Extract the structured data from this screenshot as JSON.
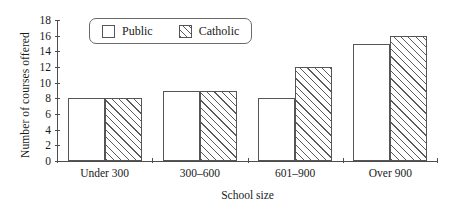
{
  "chart_data": {
    "type": "bar",
    "title": "",
    "xlabel": "School size",
    "ylabel": "Number of courses offered",
    "categories": [
      "Under 300",
      "300–600",
      "601–900",
      "Over 900"
    ],
    "series": [
      {
        "name": "Public",
        "values": [
          8,
          9,
          8,
          15
        ],
        "fill": "solid-white",
        "swatch": "legend-swatch-public"
      },
      {
        "name": "Catholic",
        "values": [
          8,
          9,
          12,
          16
        ],
        "fill": "diagonal-hatch",
        "swatch": "legend-swatch-catholic"
      }
    ],
    "ylim": [
      0,
      18
    ],
    "ytick_values": [
      0,
      2,
      4,
      6,
      8,
      10,
      12,
      14,
      16,
      18
    ],
    "ytick_labels": [
      "0",
      "2",
      "4",
      "6",
      "8",
      "10",
      "12",
      "14",
      "16",
      "18"
    ],
    "grid": false,
    "legend_position": "top-left-inside",
    "colors": {
      "axis": "#4d4d4d",
      "bar_outline": "#555555",
      "hatch": "#5a5a5a",
      "background": "#ffffff",
      "text": "#1a1a1a"
    }
  },
  "legend": {
    "entries": [
      {
        "label": "Public"
      },
      {
        "label": "Catholic"
      }
    ]
  }
}
